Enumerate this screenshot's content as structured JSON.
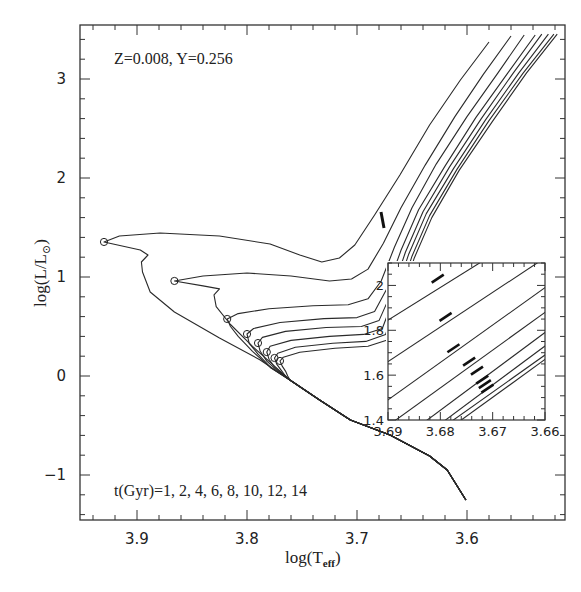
{
  "chart_data": {
    "type": "line",
    "title": "",
    "annotation_top": "Z=0.008,  Y=0.256",
    "annotation_bottom": "t(Gyr)=1, 2, 4, 6, 8, 10, 12, 14",
    "xlabel": "log(T_eff)",
    "ylabel": "log(L/L⊙)",
    "xlim": [
      3.952,
      3.509
    ],
    "ylim": [
      -1.45,
      3.56
    ],
    "x_ticks": [
      3.9,
      3.8,
      3.7,
      3.6
    ],
    "x_tick_labels": [
      "3.9",
      "3.8",
      "3.7",
      "3.6"
    ],
    "y_ticks": [
      -1,
      0,
      1,
      2,
      3
    ],
    "y_tick_labels": [
      "−1",
      "0",
      "1",
      "2",
      "3"
    ],
    "grid": false,
    "legend": null,
    "series": [
      {
        "name": "1 Gyr",
        "turnoff": [
          3.93,
          1.354
        ],
        "points": [
          [
            3.58,
            3.374
          ],
          [
            3.606,
            2.99
          ],
          [
            3.634,
            2.535
          ],
          [
            3.661,
            2.03
          ],
          [
            3.684,
            1.626
          ],
          [
            3.702,
            1.323
          ],
          [
            3.716,
            1.192
          ],
          [
            3.732,
            1.152
          ],
          [
            3.752,
            1.222
          ],
          [
            3.779,
            1.333
          ],
          [
            3.825,
            1.414
          ],
          [
            3.879,
            1.444
          ],
          [
            3.916,
            1.414
          ],
          [
            3.93,
            1.354
          ],
          [
            3.897,
            1.273
          ],
          [
            3.89,
            1.222
          ],
          [
            3.896,
            1.152
          ],
          [
            3.895,
            1.051
          ],
          [
            3.888,
            0.848
          ],
          [
            3.866,
            0.646
          ],
          [
            3.825,
            0.384
          ],
          [
            3.788,
            0.162
          ],
          [
            3.761,
            -0.04
          ]
        ]
      },
      {
        "name": "2 Gyr",
        "turnoff": [
          3.866,
          0.96
        ],
        "points": [
          [
            3.56,
            3.434
          ],
          [
            3.585,
            3.05
          ],
          [
            3.611,
            2.62
          ],
          [
            3.638,
            2.13
          ],
          [
            3.66,
            1.7
          ],
          [
            3.676,
            1.34
          ],
          [
            3.69,
            1.08
          ],
          [
            3.705,
            0.98
          ],
          [
            3.725,
            0.96
          ],
          [
            3.76,
            1.01
          ],
          [
            3.8,
            1.04
          ],
          [
            3.84,
            1.01
          ],
          [
            3.866,
            0.96
          ],
          [
            3.84,
            0.91
          ],
          [
            3.825,
            0.88
          ],
          [
            3.83,
            0.82
          ],
          [
            3.828,
            0.7
          ],
          [
            3.815,
            0.52
          ],
          [
            3.795,
            0.3
          ],
          [
            3.775,
            0.1
          ],
          [
            3.761,
            -0.04
          ]
        ]
      },
      {
        "name": "4 Gyr",
        "turnoff": [
          3.818,
          0.576
        ],
        "points": [
          [
            3.548,
            3.444
          ],
          [
            3.572,
            3.06
          ],
          [
            3.6,
            2.62
          ],
          [
            3.628,
            2.14
          ],
          [
            3.65,
            1.7
          ],
          [
            3.666,
            1.3
          ],
          [
            3.678,
            0.96
          ],
          [
            3.69,
            0.78
          ],
          [
            3.708,
            0.72
          ],
          [
            3.74,
            0.71
          ],
          [
            3.78,
            0.68
          ],
          [
            3.808,
            0.63
          ],
          [
            3.818,
            0.576
          ],
          [
            3.815,
            0.5
          ],
          [
            3.808,
            0.4
          ],
          [
            3.795,
            0.25
          ],
          [
            3.778,
            0.08
          ],
          [
            3.761,
            -0.04
          ]
        ]
      },
      {
        "name": "6 Gyr",
        "turnoff": [
          3.8,
          0.424
        ],
        "points": [
          [
            3.538,
            3.444
          ],
          [
            3.563,
            3.06
          ],
          [
            3.592,
            2.61
          ],
          [
            3.62,
            2.12
          ],
          [
            3.644,
            1.68
          ],
          [
            3.66,
            1.27
          ],
          [
            3.672,
            0.9
          ],
          [
            3.684,
            0.65
          ],
          [
            3.7,
            0.59
          ],
          [
            3.73,
            0.58
          ],
          [
            3.77,
            0.54
          ],
          [
            3.794,
            0.48
          ],
          [
            3.8,
            0.424
          ],
          [
            3.798,
            0.33
          ],
          [
            3.79,
            0.22
          ],
          [
            3.778,
            0.08
          ],
          [
            3.761,
            -0.04
          ]
        ]
      },
      {
        "name": "8 Gyr",
        "turnoff": [
          3.79,
          0.333
        ],
        "points": [
          [
            3.532,
            3.454
          ],
          [
            3.558,
            3.06
          ],
          [
            3.587,
            2.6
          ],
          [
            3.616,
            2.11
          ],
          [
            3.64,
            1.66
          ],
          [
            3.656,
            1.25
          ],
          [
            3.668,
            0.86
          ],
          [
            3.68,
            0.56
          ],
          [
            3.696,
            0.5
          ],
          [
            3.728,
            0.49
          ],
          [
            3.765,
            0.45
          ],
          [
            3.786,
            0.39
          ],
          [
            3.79,
            0.333
          ],
          [
            3.788,
            0.25
          ],
          [
            3.782,
            0.15
          ],
          [
            3.772,
            0.05
          ],
          [
            3.761,
            -0.04
          ]
        ]
      },
      {
        "name": "10 Gyr",
        "turnoff": [
          3.782,
          0.242
        ],
        "points": [
          [
            3.526,
            3.454
          ],
          [
            3.553,
            3.06
          ],
          [
            3.583,
            2.59
          ],
          [
            3.612,
            2.1
          ],
          [
            3.637,
            1.64
          ],
          [
            3.653,
            1.23
          ],
          [
            3.665,
            0.83
          ],
          [
            3.677,
            0.48
          ],
          [
            3.694,
            0.42
          ],
          [
            3.725,
            0.4
          ],
          [
            3.76,
            0.36
          ],
          [
            3.779,
            0.3
          ],
          [
            3.782,
            0.242
          ],
          [
            3.78,
            0.17
          ],
          [
            3.775,
            0.09
          ],
          [
            3.768,
            0.02
          ],
          [
            3.761,
            -0.04
          ]
        ]
      },
      {
        "name": "12 Gyr",
        "turnoff": [
          3.775,
          0.182
        ],
        "points": [
          [
            3.521,
            3.454
          ],
          [
            3.549,
            3.06
          ],
          [
            3.58,
            2.58
          ],
          [
            3.609,
            2.09
          ],
          [
            3.634,
            1.62
          ],
          [
            3.65,
            1.21
          ],
          [
            3.662,
            0.8
          ],
          [
            3.674,
            0.42
          ],
          [
            3.692,
            0.35
          ],
          [
            3.722,
            0.33
          ],
          [
            3.756,
            0.29
          ],
          [
            3.772,
            0.23
          ],
          [
            3.775,
            0.182
          ],
          [
            3.773,
            0.12
          ],
          [
            3.769,
            0.06
          ],
          [
            3.765,
            0.0
          ],
          [
            3.761,
            -0.04
          ]
        ]
      },
      {
        "name": "14 Gyr",
        "turnoff": [
          3.77,
          0.152
        ],
        "points": [
          [
            3.518,
            3.454
          ],
          [
            3.546,
            3.06
          ],
          [
            3.577,
            2.57
          ],
          [
            3.607,
            2.08
          ],
          [
            3.632,
            1.6
          ],
          [
            3.648,
            1.19
          ],
          [
            3.66,
            0.77
          ],
          [
            3.671,
            0.37
          ],
          [
            3.69,
            0.3
          ],
          [
            3.72,
            0.28
          ],
          [
            3.752,
            0.24
          ],
          [
            3.767,
            0.19
          ],
          [
            3.77,
            0.152
          ],
          [
            3.768,
            0.1
          ],
          [
            3.765,
            0.05
          ],
          [
            3.763,
            0.0
          ],
          [
            3.761,
            -0.04
          ]
        ]
      }
    ],
    "shared_lower_main_sequence": [
      [
        3.761,
        -0.04
      ],
      [
        3.734,
        -0.242
      ],
      [
        3.706,
        -0.444
      ],
      [
        3.67,
        -0.596
      ],
      [
        3.634,
        -0.808
      ],
      [
        3.618,
        -0.949
      ],
      [
        3.601,
        -1.253
      ]
    ],
    "inset": {
      "xlim": [
        3.69,
        3.66
      ],
      "ylim": [
        1.4,
        2.1
      ],
      "x_ticks": [
        3.69,
        3.68,
        3.67,
        3.66
      ],
      "x_tick_labels": [
        "3.69",
        "3.68",
        "3.67",
        "3.66"
      ],
      "y_ticks": [
        1.4,
        1.6,
        1.8,
        2.0
      ],
      "y_tick_labels": [
        "1.4",
        "1.6",
        "1.8",
        "2"
      ],
      "lines": [
        {
          "name": "1 Gyr",
          "from": [
            3.69,
            1.845
          ],
          "to": [
            3.6725,
            2.1
          ],
          "clump": [
            3.6805,
            2.03
          ]
        },
        {
          "name": "2 Gyr",
          "from": [
            3.69,
            1.66
          ],
          "to": [
            3.6615,
            2.1
          ],
          "clump": [
            3.679,
            1.86
          ]
        },
        {
          "name": "4 Gyr",
          "from": [
            3.69,
            1.49
          ],
          "to": [
            3.66,
            1.99
          ],
          "clump": [
            3.6775,
            1.72
          ]
        },
        {
          "name": "6 Gyr",
          "from": [
            3.6885,
            1.4
          ],
          "to": [
            3.66,
            1.88
          ],
          "clump": [
            3.6745,
            1.66
          ]
        },
        {
          "name": "8 Gyr",
          "from": [
            3.6825,
            1.4
          ],
          "to": [
            3.66,
            1.79
          ],
          "clump": [
            3.673,
            1.62
          ]
        },
        {
          "name": "10 Gyr",
          "from": [
            3.679,
            1.4
          ],
          "to": [
            3.66,
            1.73
          ],
          "clump": [
            3.672,
            1.58
          ]
        },
        {
          "name": "12 Gyr",
          "from": [
            3.6775,
            1.4
          ],
          "to": [
            3.66,
            1.69
          ],
          "clump": [
            3.6715,
            1.56
          ]
        },
        {
          "name": "14 Gyr",
          "from": [
            3.676,
            1.4
          ],
          "to": [
            3.66,
            1.67
          ],
          "clump": [
            3.671,
            1.54
          ]
        }
      ]
    }
  }
}
